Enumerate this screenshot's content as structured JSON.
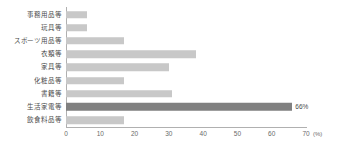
{
  "chart_data": {
    "type": "bar",
    "orientation": "horizontal",
    "title": "",
    "xlabel": "(%)",
    "ylabel": "",
    "xlim": [
      0,
      70
    ],
    "xticks": [
      0,
      10,
      20,
      30,
      40,
      50,
      60,
      70
    ],
    "xtick_labels": [
      "0",
      "10",
      "20",
      "30",
      "40",
      "50",
      "60",
      "70"
    ],
    "unit_label": "(%)",
    "grid": false,
    "legend": "none",
    "categories": [
      "事務用品等",
      "玩具等",
      "スポーツ用品等",
      "衣類等",
      "家具等",
      "化粧品等",
      "書籍等",
      "生活家電等",
      "飲食料品等"
    ],
    "values": [
      6,
      6,
      17,
      38,
      30,
      17,
      31,
      66,
      17
    ],
    "data_labels": [
      "",
      "",
      "",
      "",
      "",
      "",
      "",
      "66%",
      ""
    ],
    "highlight_index": 7,
    "colors": {
      "bar": "#c8c8c8",
      "bar_highlight": "#808080",
      "axis": "#b0b0b0",
      "label_text": "#4a4a4a",
      "tick_text": "#6a6a6a",
      "background": "#ffffff"
    }
  }
}
